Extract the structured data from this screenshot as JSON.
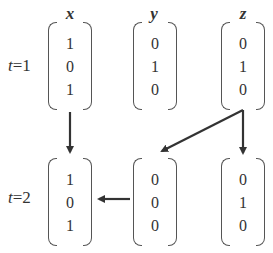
{
  "diagram": {
    "variables": [
      "x",
      "y",
      "z"
    ],
    "time_labels": [
      "t=1",
      "t=2"
    ],
    "states": {
      "t1": {
        "x": [
          "1",
          "0",
          "1"
        ],
        "y": [
          "0",
          "1",
          "0"
        ],
        "z": [
          "0",
          "1",
          "0"
        ]
      },
      "t2": {
        "x": [
          "1",
          "0",
          "1"
        ],
        "y": [
          "0",
          "0",
          "0"
        ],
        "z": [
          "0",
          "1",
          "0"
        ]
      }
    },
    "arrows": [
      {
        "from": "t1.x",
        "to": "t2.x",
        "direction": "down"
      },
      {
        "from": "t1.z",
        "to": "t2.y",
        "direction": "diagonal-down-left"
      },
      {
        "from": "t1.z",
        "to": "t2.z",
        "direction": "down"
      },
      {
        "from": "t2.y",
        "to": "t2.x",
        "direction": "left"
      }
    ],
    "colors": {
      "stroke": "#333333",
      "background": "#ffffff"
    }
  }
}
